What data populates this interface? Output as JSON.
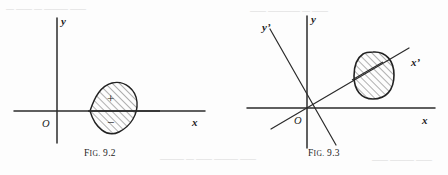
{
  "page": {
    "width": 448,
    "height": 175,
    "background_color": "#fdfdfd",
    "ink_color": "#2b2b2b"
  },
  "figures": [
    {
      "id": "fig-9-2",
      "caption_prefix": "F",
      "caption_smallcaps": "IG.",
      "caption_number": "9.2",
      "caption_full": "FIG. 9.2",
      "axes": {
        "origin_label": "O",
        "x_label": "x",
        "y_label": "y",
        "origin": [
          57,
          111
        ],
        "x_axis": [
          14,
          205
        ],
        "y_axis": [
          18,
          143
        ]
      },
      "region": {
        "shape": "teardrop",
        "description": "hatched leaf/teardrop region with cusp on the x-axis at left and rounded bulge at right, straddling the x-axis",
        "hatching": "diagonal-45",
        "cusp_point": [
          90,
          111
        ],
        "signs": [
          {
            "label": "+",
            "position": "upper-half",
            "x": 112,
            "y": 98
          },
          {
            "label": "−",
            "position": "lower-half",
            "x": 112,
            "y": 121
          }
        ]
      }
    },
    {
      "id": "fig-9-3",
      "caption_prefix": "F",
      "caption_smallcaps": "IG.",
      "caption_number": "9.3",
      "caption_full": "FIG. 9.3",
      "axes": {
        "origin_label": "O",
        "x_label": "x",
        "y_label": "y",
        "x_prime_label": "x'",
        "y_prime_label": "y'",
        "origin": [
          307,
          108
        ],
        "x_axis": [
          247,
          435
        ],
        "y_axis": [
          16,
          148
        ],
        "x_prime_axis": [
          [
            271,
            128
          ],
          [
            408,
            48
          ]
        ],
        "y_prime_axis": [
          [
            270,
            30
          ],
          [
            335,
            145
          ]
        ]
      },
      "region": {
        "shape": "oval-blob",
        "description": "hatched rounded blob lying in the first quadrant, crossed near its upper-left edge by the x' axis",
        "hatching": "diagonal-45",
        "center": [
          374,
          75
        ]
      }
    }
  ],
  "background_artifacts": {
    "description": "faint scanner bleed-through marks",
    "items": [
      {
        "text": "—  ——  — ———  ——",
        "x": 6,
        "y": 6
      },
      {
        "text": "——  ————  —  ——",
        "x": 250,
        "y": 8
      },
      {
        "text": "———  —  ——  ——— ——",
        "x": 160,
        "y": 156
      },
      {
        "text": "—— ———  ——",
        "x": 372,
        "y": 157
      }
    ]
  }
}
